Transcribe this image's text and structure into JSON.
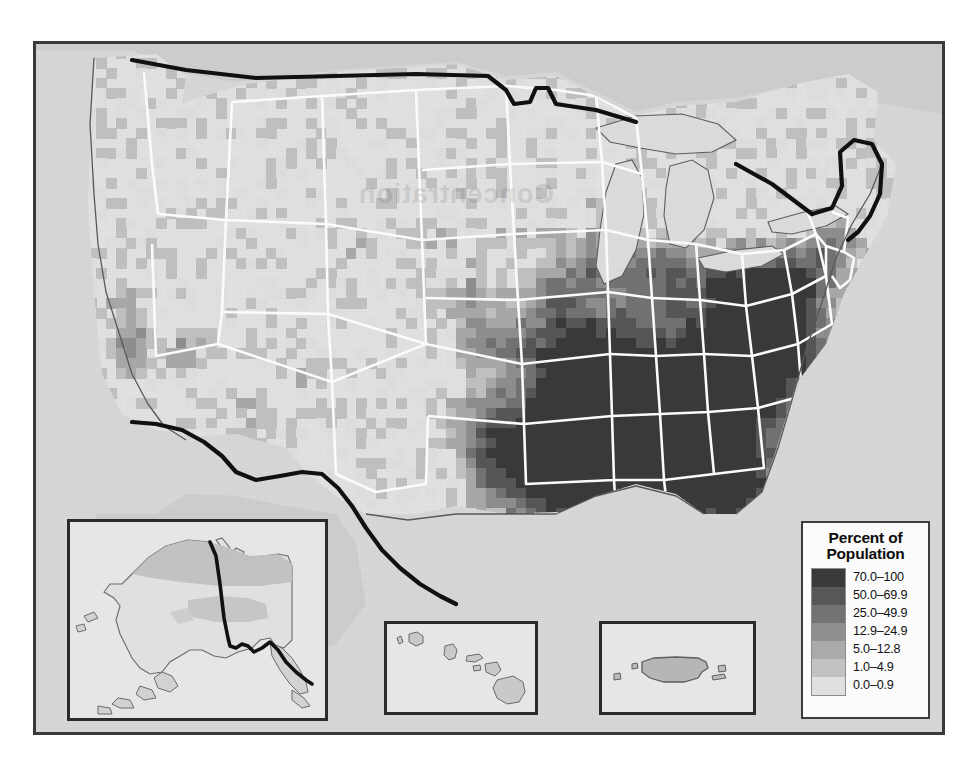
{
  "map": {
    "kind": "choropleth",
    "subject": "United States counties shaded by percent of population",
    "frame_color": "#3a3a3a",
    "background_color": "#dcdcdc",
    "land_color": "#e2e2e2",
    "water_color": "#d6d6d6",
    "neighbor_country_color": "#cfcfcf",
    "state_border_color": "#ffffff",
    "national_border_color": "#121212",
    "coastline_color": "#5a5a5a",
    "watermark_text": "Concentration"
  },
  "legend": {
    "title_line1": "Percent of",
    "title_line2": "Population",
    "classes": [
      {
        "label": "70.0–100",
        "color": "#3a3a3a"
      },
      {
        "label": "50.0–69.9",
        "color": "#575757"
      },
      {
        "label": "25.0–49.9",
        "color": "#737373"
      },
      {
        "label": "12.9–24.9",
        "color": "#8f8f8f"
      },
      {
        "label": "5.0–12.8",
        "color": "#aaaaaa"
      },
      {
        "label": "1.0–4.9",
        "color": "#c2c2c2"
      },
      {
        "label": "0.0–0.9",
        "color": "#e0e0e0"
      }
    ]
  },
  "insets": [
    {
      "id": "alaska",
      "name": "Alaska inset map"
    },
    {
      "id": "hawaii",
      "name": "Hawaii inset map"
    },
    {
      "id": "puertorico",
      "name": "Puerto Rico inset map"
    }
  ]
}
